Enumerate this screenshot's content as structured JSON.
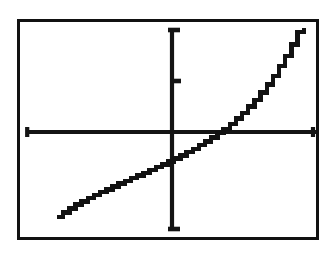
{
  "screen": {
    "label": "graphing-calculator-plot",
    "background_color": "#ffffff",
    "ink_color": "#121212",
    "border_color": "#111111",
    "border_width_px": 3
  },
  "chart_data": {
    "type": "line",
    "title": "",
    "subtitle": "",
    "xlabel": "",
    "ylabel": "",
    "grid": false,
    "legend": false,
    "legend_entries": [],
    "annotations": [],
    "axis_style": "centered-cross",
    "xlim": [
      -4.7,
      4.7
    ],
    "ylim": [
      -3.1,
      3.1
    ],
    "xticks": [
      -4.7,
      4.7
    ],
    "yticks": [
      3.1,
      1.55,
      -3.1
    ],
    "xticklabels": [],
    "yticklabels": [],
    "x_axis_y_value": 0,
    "y_axis_x_value": 0,
    "series": [
      {
        "name": "curve",
        "description": "increasing concave-up curve crossing x-axis in right half",
        "x": [
          -3.6,
          -3.4,
          -3.2,
          -3.0,
          -2.8,
          -2.6,
          -2.4,
          -2.2,
          -2.0,
          -1.8,
          -1.6,
          -1.4,
          -1.2,
          -1.0,
          -0.8,
          -0.6,
          -0.4,
          -0.2,
          0.0,
          0.2,
          0.4,
          0.6,
          0.8,
          1.0,
          1.2,
          1.4,
          1.6,
          1.8,
          2.0,
          2.2,
          2.4,
          2.6,
          2.8,
          3.0,
          3.2,
          3.4,
          3.6,
          3.8,
          4.0,
          4.2,
          4.4
        ],
        "y": [
          -2.62,
          -2.48,
          -2.36,
          -2.25,
          -2.15,
          -2.05,
          -1.96,
          -1.87,
          -1.79,
          -1.7,
          -1.62,
          -1.54,
          -1.46,
          -1.38,
          -1.3,
          -1.22,
          -1.13,
          -1.05,
          -0.96,
          -0.87,
          -0.78,
          -0.68,
          -0.58,
          -0.47,
          -0.36,
          -0.24,
          -0.11,
          0.02,
          0.17,
          0.33,
          0.5,
          0.69,
          0.89,
          1.11,
          1.35,
          1.61,
          1.9,
          2.21,
          2.55,
          2.92,
          3.05
        ]
      }
    ],
    "x_axis_crossing": 1.72,
    "y_axis_crossing": -0.96
  },
  "geometry": {
    "x_axis_start_px": 6,
    "x_axis_end_px": 296,
    "x_axis_y_px": 110,
    "y_axis_x_px": 152,
    "y_axis_top_px": 6,
    "y_axis_bottom_px": 209,
    "y_tick_px": 59,
    "curve_start_px": [
      45,
      206
    ],
    "curve_end_px": [
      295,
      59
    ]
  }
}
